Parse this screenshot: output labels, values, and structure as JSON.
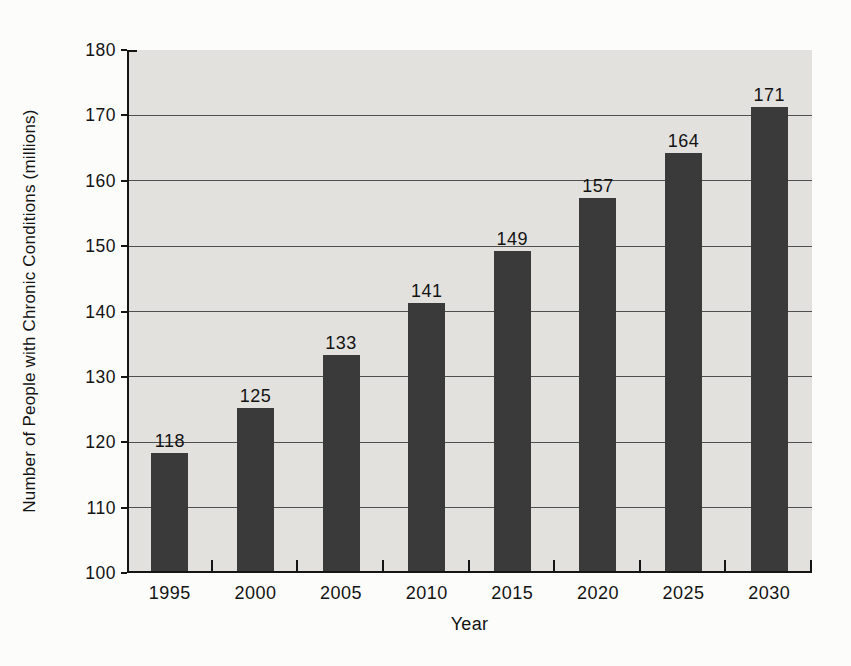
{
  "chart_data": {
    "type": "bar",
    "categories": [
      "1995",
      "2000",
      "2005",
      "2010",
      "2015",
      "2020",
      "2025",
      "2030"
    ],
    "values": [
      118,
      125,
      133,
      141,
      149,
      157,
      164,
      171
    ],
    "title": "",
    "xlabel": "Year",
    "ylabel": "Number of People with Chronic Conditions (millions)",
    "ylim": [
      100,
      180
    ],
    "ytick_step": 10,
    "grid": true,
    "legend": "none",
    "bar_color": "#3a3a3a",
    "plot_background": "#e2e1de",
    "gridline_color": "#4f4f4f",
    "axis_color": "#151515",
    "page_background": "#fcfcfa"
  }
}
